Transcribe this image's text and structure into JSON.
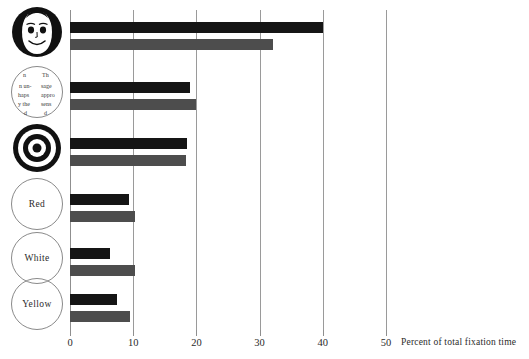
{
  "chart_data": {
    "type": "bar",
    "orientation": "horizontal",
    "title": "",
    "xlabel": "Percent of total fixation time",
    "ylabel": "",
    "xlim": [
      0,
      50
    ],
    "xticks": [
      0,
      10,
      20,
      30,
      40,
      50
    ],
    "xticklabels": [
      "0",
      "10",
      "20",
      "30",
      "40",
      "50"
    ],
    "grid": true,
    "legend": "none",
    "categories": [
      "face",
      "text-circle",
      "bullseye",
      "Red",
      "White",
      "Yellow"
    ],
    "category_labels": [
      "",
      "",
      "",
      "Red",
      "White",
      "Yellow"
    ],
    "series": [
      {
        "name": "dark",
        "color": "#151515",
        "values": [
          40.0,
          19.0,
          18.5,
          9.3,
          6.3,
          7.4
        ]
      },
      {
        "name": "light",
        "color": "#4d4d4d",
        "values": [
          32.1,
          20.0,
          18.4,
          10.3,
          10.3,
          9.5
        ]
      }
    ]
  },
  "axis": {
    "title": "Percent of total fixation time",
    "ticks": [
      {
        "value": 0,
        "label": "0"
      },
      {
        "value": 10,
        "label": "10"
      },
      {
        "value": 20,
        "label": "20"
      },
      {
        "value": 30,
        "label": "30"
      },
      {
        "value": 40,
        "label": "40"
      },
      {
        "value": 50,
        "label": "50"
      }
    ]
  },
  "categories": [
    {
      "id": "face",
      "icon": "smiling-face-icon",
      "label": "",
      "dark": 40.0,
      "light": 32.1
    },
    {
      "id": "text-circle",
      "icon": "text-fragment-circle-icon",
      "label": "",
      "text_fragments": [
        "n",
        "Th",
        "n un-",
        "sage",
        "haps",
        "appro",
        "y the",
        "sens"
      ],
      "dark": 19.0,
      "light": 20.0
    },
    {
      "id": "bullseye",
      "icon": "bullseye-target-icon",
      "label": "",
      "dark": 18.5,
      "light": 18.4
    },
    {
      "id": "red",
      "icon": "color-swatch-circle-icon",
      "label": "Red",
      "dark": 9.3,
      "light": 10.3
    },
    {
      "id": "white",
      "icon": "color-swatch-circle-icon",
      "label": "White",
      "dark": 6.3,
      "light": 10.3
    },
    {
      "id": "yellow",
      "icon": "color-swatch-circle-icon",
      "label": "Yellow",
      "dark": 7.4,
      "light": 9.5
    }
  ],
  "colors": {
    "dark_bar": "#151515",
    "light_bar": "#4d4d4d",
    "gridline": "#9a9a9a",
    "text": "#2b2b2b",
    "background": "#ffffff"
  }
}
